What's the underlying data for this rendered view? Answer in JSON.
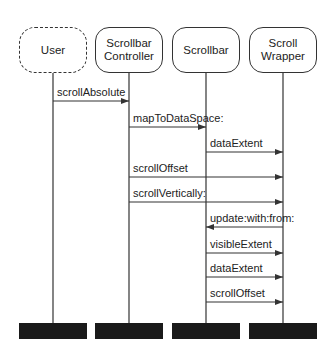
{
  "participants": [
    {
      "id": "user",
      "label": "User",
      "x": 53,
      "style": "dashed"
    },
    {
      "id": "scrollbar-controller",
      "label": "Scrollbar\nController",
      "x": 129,
      "style": "solid"
    },
    {
      "id": "scrollbar",
      "label": "Scrollbar",
      "x": 206,
      "style": "solid"
    },
    {
      "id": "scroll-wrapper",
      "label": "Scroll\nWrapper",
      "x": 283,
      "style": "solid"
    }
  ],
  "layout": {
    "head_top": 27,
    "head_height": 46,
    "lifeline_end": 323,
    "bar_top": 323,
    "bar_height": 16
  },
  "messages": [
    {
      "label": "scrollAbsolute",
      "from": 0,
      "to": 1,
      "y": 101
    },
    {
      "label": "mapToDataSpace:",
      "from": 1,
      "to": 2,
      "y": 127
    },
    {
      "label": "dataExtent",
      "from": 2,
      "to": 3,
      "y": 152
    },
    {
      "label": "scrollOffset",
      "from": 1,
      "to": 3,
      "y": 177
    },
    {
      "label": "scrollVertically:",
      "from": 1,
      "to": 3,
      "y": 202
    },
    {
      "label": "update:with:from:",
      "from": 3,
      "to": 2,
      "y": 227
    },
    {
      "label": "visibleExtent",
      "from": 2,
      "to": 3,
      "y": 253
    },
    {
      "label": "dataExtent",
      "from": 2,
      "to": 3,
      "y": 277
    },
    {
      "label": "scrollOffset",
      "from": 2,
      "to": 3,
      "y": 302
    }
  ],
  "colors": {
    "line": "#333333",
    "bar": "#1a1a1a",
    "background": "#ffffff"
  }
}
